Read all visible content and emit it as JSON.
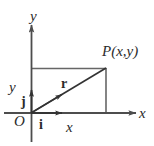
{
  "figure": {
    "type": "vector-diagram",
    "colors": {
      "line": "#4d4d4d",
      "text": "#2b2b2b",
      "background": "#ffffff"
    },
    "axes": {
      "y_axis_label": "y",
      "x_axis_label": "x",
      "origin_label": "O"
    },
    "points": {
      "point_label": "P(x,y)"
    },
    "vectors": {
      "position_vector_label": "r",
      "unit_vector_x_label": "i",
      "unit_vector_y_label": "j"
    },
    "components": {
      "vertical_component_label": "y",
      "horizontal_component_label": "x"
    },
    "geometry": {
      "origin": [
        31,
        113
      ],
      "point_P": [
        106,
        68
      ],
      "y_axis_top": [
        31,
        25
      ],
      "x_axis_right": [
        136,
        113
      ],
      "unit_i_tip": [
        64,
        113
      ],
      "unit_j_tip": [
        31,
        88
      ]
    }
  }
}
